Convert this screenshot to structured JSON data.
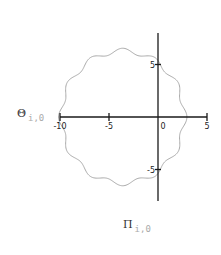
{
  "chart_data": {
    "type": "line",
    "title": "",
    "xlabel": {
      "main": "Π",
      "sub": "i,0"
    },
    "ylabel": {
      "main": "Θ",
      "sub": "i,0"
    },
    "xlim": [
      -10,
      5
    ],
    "ylim": [
      -8,
      8
    ],
    "xticks": [
      -10,
      -5,
      0,
      5
    ],
    "xtick_labels": [
      "-10",
      "-5",
      "0",
      "5"
    ],
    "yticks": [
      5,
      -5
    ],
    "ytick_labels": [
      "5",
      "-5"
    ],
    "grid": false,
    "legend": null,
    "series": [
      {
        "name": "Θ vs Π (closed wavy curve)",
        "shape": "r(t) = R + a*cos(n*t)",
        "center": [
          -3.6,
          0
        ],
        "R": 6.3,
        "a": 0.25,
        "n": 12,
        "color": "#aaaaaa"
      }
    ]
  },
  "colors": {
    "axis": "#1a1a1a",
    "curve": "#aaaaaa",
    "sublabel": "#aaaaaa"
  }
}
